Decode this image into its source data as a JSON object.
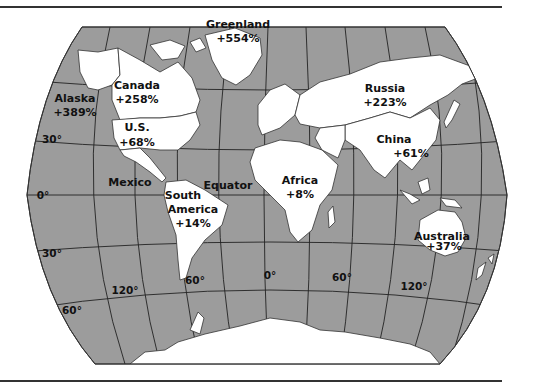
{
  "map": {
    "title": "World map: projected change by region",
    "colors": {
      "ocean": "#9c9c9c",
      "land": "#ffffff",
      "lines": "#222222",
      "text": "#111111"
    },
    "regions": [
      {
        "id": "greenland",
        "name": "Greenland",
        "value": "+554%"
      },
      {
        "id": "canada",
        "name": "Canada",
        "value": "+258%"
      },
      {
        "id": "alaska",
        "name": "Alaska",
        "value": "+389%"
      },
      {
        "id": "us",
        "name": "U.S.",
        "value": "+68%"
      },
      {
        "id": "mexico",
        "name": "Mexico",
        "value": ""
      },
      {
        "id": "south-america",
        "name": "South America",
        "name_line1": "South",
        "name_line2": "America",
        "value": "+14%"
      },
      {
        "id": "russia",
        "name": "Russia",
        "value": "+223%"
      },
      {
        "id": "china",
        "name": "China",
        "value": "+61%"
      },
      {
        "id": "africa",
        "name": "Africa",
        "value": "+8%"
      },
      {
        "id": "australia",
        "name": "Australia",
        "value": "+37%"
      }
    ],
    "annotations": {
      "equator": "Equator"
    },
    "latitude_labels": [
      "30°",
      "0°",
      "30°",
      "60°"
    ],
    "longitude_labels": [
      "120°",
      "60°",
      "0°",
      "60°",
      "120°"
    ]
  }
}
